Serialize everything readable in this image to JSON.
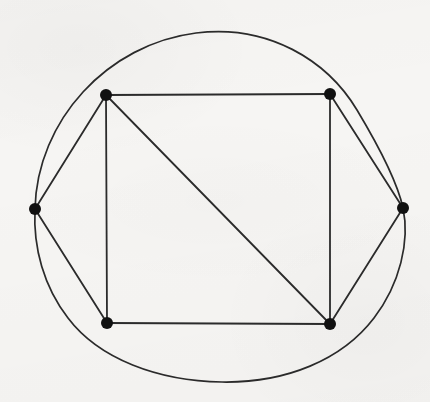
{
  "figure": {
    "kind": "graph-drawing",
    "canvas": {
      "width": 430,
      "height": 402
    },
    "background_color": "#f6f5f3",
    "stroke_color": "#2b2b2b",
    "vertex_color": "#111111",
    "vertex_radius": 6,
    "edge_width": 1.8,
    "curve_width": 1.7
  },
  "chart_data": {
    "type": "scatter",
    "xlabel": "",
    "ylabel": "",
    "xlim": [
      0,
      430
    ],
    "ylim": [
      0,
      402
    ],
    "grid": false,
    "legend": "none",
    "vertices": [
      {
        "id": "top-left",
        "label": "",
        "x": 106,
        "y": 95
      },
      {
        "id": "top-right",
        "label": "",
        "x": 330,
        "y": 94
      },
      {
        "id": "left",
        "label": "",
        "x": 35,
        "y": 209
      },
      {
        "id": "right",
        "label": "",
        "x": 403,
        "y": 208
      },
      {
        "id": "bottom-left",
        "label": "",
        "x": 107,
        "y": 323
      },
      {
        "id": "bottom-right",
        "label": "",
        "x": 330,
        "y": 324
      }
    ],
    "edges": [
      {
        "from": "top-left",
        "to": "top-right",
        "kind": "straight"
      },
      {
        "from": "top-right",
        "to": "bottom-right",
        "kind": "straight"
      },
      {
        "from": "bottom-right",
        "to": "bottom-left",
        "kind": "straight"
      },
      {
        "from": "bottom-left",
        "to": "top-left",
        "kind": "straight"
      },
      {
        "from": "top-left",
        "to": "bottom-right",
        "kind": "straight"
      },
      {
        "from": "left",
        "to": "top-left",
        "kind": "straight"
      },
      {
        "from": "left",
        "to": "bottom-left",
        "kind": "straight"
      },
      {
        "from": "top-right",
        "to": "right",
        "kind": "straight"
      },
      {
        "from": "right",
        "to": "bottom-right",
        "kind": "straight"
      }
    ],
    "closed_curve": {
      "description": "large closed roughly-circular curve enclosing the polygon, passing through the left and right vertices",
      "center_x": 218,
      "center_y": 208,
      "radius_x": 184,
      "radius_y": 175
    }
  },
  "paths": {
    "edge_top": "M 106 95 L 330 94",
    "edge_right_side": "M 330 94 L 330 324",
    "edge_bottom": "M 330 324 L 107 323",
    "edge_left_side": "M 107 323 L 106 95",
    "edge_diagonal": "M 106 95 L 330 324",
    "edge_left_to_tl": "M 35 209 L 106 95",
    "edge_left_to_bl": "M 35 209 L 107 323",
    "edge_tr_to_right": "M 330 94 L 403 208",
    "edge_right_to_br": "M 403 208 L 330 324",
    "closed_curve": "M 35 209 C 37 120 108 44 196 33 C 268 24 327 60 357 110 C 378 145 397 180 403 208 C 410 241 400 284 374 318 C 342 360 286 383 222 382 C 158 381 99 359 68 318 C 44 287 33 248 35 209 Z"
  }
}
